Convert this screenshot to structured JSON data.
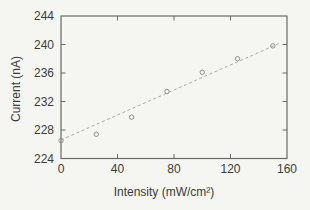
{
  "figure": {
    "background": "#f5f5f1",
    "frame_color": "#6a6a6a",
    "text_color": "#3b3b3b",
    "marker_color": "#8f8f8f",
    "fit_line_color": "#a0a0a0"
  },
  "chart_data": {
    "type": "scatter",
    "title": "",
    "xlabel": "Intensity (mW/cm²)",
    "ylabel": "Current (nA)",
    "xlim": [
      0,
      160
    ],
    "ylim": [
      224,
      244
    ],
    "x_ticks": [
      0,
      40,
      80,
      120,
      160
    ],
    "y_ticks": [
      224,
      228,
      232,
      236,
      240,
      244
    ],
    "grid": false,
    "legend_position": "none",
    "marker": "open-circle",
    "points": {
      "x": [
        0,
        25,
        50,
        75,
        100,
        125,
        150
      ],
      "y": [
        226.5,
        227.4,
        229.8,
        233.4,
        236.1,
        238.0,
        239.8
      ]
    },
    "fit_line": {
      "style": "dashed",
      "x": [
        0,
        155
      ],
      "y": [
        226.6,
        240.2
      ]
    }
  }
}
